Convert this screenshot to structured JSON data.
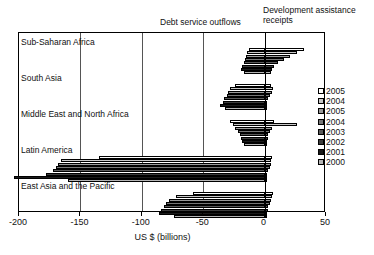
{
  "captions": {
    "debt": "Debt service outflows",
    "aid": "Development assistance receipts"
  },
  "axis": {
    "title": "US $ (billions)",
    "ticks": [
      "-200",
      "-150",
      "-100",
      "-50",
      "0",
      "50"
    ],
    "tick_values": [
      -200,
      -150,
      -100,
      -50,
      0,
      50
    ],
    "min": -200,
    "max": 50
  },
  "legend": {
    "items": [
      {
        "label": "2005",
        "color": "#ffffff"
      },
      {
        "label": "2004",
        "color": "#c8c8c8"
      },
      {
        "label": "2005",
        "color": "#9a9a9a"
      },
      {
        "label": "2004",
        "color": "#777777"
      },
      {
        "label": "2003",
        "color": "#5a5a5a"
      },
      {
        "label": "2002",
        "color": "#3d3d3d"
      },
      {
        "label": "2001",
        "color": "#1a1a1a"
      },
      {
        "label": "2000",
        "color": "#b4b4b4"
      }
    ]
  },
  "chart_data": {
    "type": "bar",
    "orientation": "horizontal",
    "title": "",
    "xlabel": "US $ (billions)",
    "ylabel": "",
    "xlim": [
      -200,
      50
    ],
    "grid": true,
    "legend_position": "right",
    "annotations": [
      "Debt service outflows",
      "Development assistance receipts"
    ],
    "categories": [
      "Sub-Saharan Africa",
      "South Asia",
      "Middle East and North Africa",
      "Latin America",
      "East Asia and the Pacific"
    ],
    "series": [
      {
        "name": "2005",
        "color": "#ffffff",
        "values": [
          32,
          5,
          8,
          6,
          7
        ]
      },
      {
        "name": "2004",
        "color": "#c8c8c8",
        "values": [
          26,
          7,
          26,
          5,
          6
        ]
      },
      {
        "name": "2005b",
        "color": "#9a9a9a",
        "values": [
          21,
          6,
          6,
          5,
          5
        ]
      },
      {
        "name": "2004b",
        "color": "#777777",
        "values": [
          16,
          4,
          4,
          4,
          4
        ]
      },
      {
        "name": "2003",
        "color": "#5a5a5a",
        "values": [
          11,
          3,
          3,
          3,
          3
        ]
      },
      {
        "name": "2002",
        "color": "#3d3d3d",
        "values": [
          8,
          2,
          3,
          2,
          3
        ]
      },
      {
        "name": "2001",
        "color": "#1a1a1a",
        "values": [
          6,
          2,
          2,
          2,
          2
        ]
      },
      {
        "name": "2000",
        "color": "#b4b4b4",
        "values": [
          5,
          2,
          2,
          2,
          2
        ]
      }
    ],
    "debt_series": [
      {
        "name": "2005",
        "color": "#ffffff",
        "values": [
          -13,
          -24,
          -28,
          -135,
          -58
        ]
      },
      {
        "name": "2004",
        "color": "#c8c8c8",
        "values": [
          -14,
          -28,
          -26,
          -166,
          -72
        ]
      },
      {
        "name": "2005b",
        "color": "#9a9a9a",
        "values": [
          -15,
          -30,
          -24,
          -168,
          -78
        ]
      },
      {
        "name": "2004b",
        "color": "#777777",
        "values": [
          -16,
          -31,
          -22,
          -170,
          -80
        ]
      },
      {
        "name": "2003",
        "color": "#5a5a5a",
        "values": [
          -17,
          -33,
          -20,
          -172,
          -82
        ]
      },
      {
        "name": "2002",
        "color": "#3d3d3d",
        "values": [
          -18,
          -34,
          -19,
          -178,
          -84
        ]
      },
      {
        "name": "2001",
        "color": "#1a1a1a",
        "values": [
          -19,
          -36,
          -18,
          -204,
          -86
        ]
      },
      {
        "name": "2000",
        "color": "#b4b4b4",
        "values": [
          -17,
          -32,
          -17,
          -160,
          -74
        ]
      }
    ]
  }
}
